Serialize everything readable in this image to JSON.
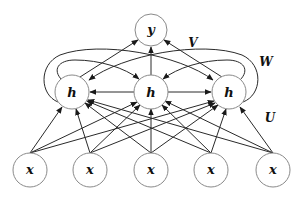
{
  "diagram": {
    "type": "recurrent-neural-network",
    "nodes": {
      "output": {
        "label": "y",
        "cx": 151,
        "cy": 30,
        "r": 16
      },
      "hidden": [
        {
          "label": "h",
          "cx": 72,
          "cy": 92,
          "r": 17
        },
        {
          "label": "h",
          "cx": 151,
          "cy": 92,
          "r": 17
        },
        {
          "label": "h",
          "cx": 229,
          "cy": 92,
          "r": 17
        }
      ],
      "input": [
        {
          "label": "x",
          "cx": 30,
          "cy": 170,
          "r": 17
        },
        {
          "label": "x",
          "cx": 90,
          "cy": 170,
          "r": 17
        },
        {
          "label": "x",
          "cx": 151,
          "cy": 170,
          "r": 17
        },
        {
          "label": "x",
          "cx": 211,
          "cy": 170,
          "r": 17
        },
        {
          "label": "x",
          "cx": 273,
          "cy": 170,
          "r": 17
        }
      ]
    },
    "weights": {
      "V": {
        "label": "V",
        "x": 193,
        "y": 43
      },
      "W": {
        "label": "W",
        "x": 266,
        "y": 62
      },
      "U": {
        "label": "U",
        "x": 270,
        "y": 118
      }
    },
    "colors": {
      "edge": "#2a2a2a",
      "node_stroke": "#8a8a8a",
      "background": "#ffffff"
    }
  }
}
